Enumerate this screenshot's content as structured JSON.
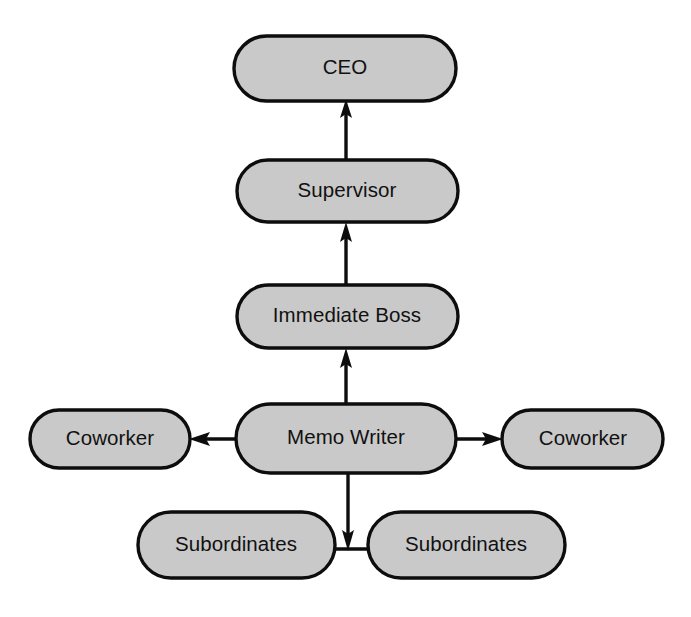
{
  "diagram": {
    "type": "flow-diagram",
    "canvas": {
      "width": 691,
      "height": 617
    },
    "background_color": "#ffffff",
    "node_fill_color": "#c9c9c9",
    "node_border_color": "#0d0d0d",
    "connector_color": "#0d0d0d",
    "nodes": [
      {
        "id": "ceo",
        "label": "CEO",
        "shape": "stadium",
        "x": 234,
        "y": 36,
        "width": 222,
        "height": 65,
        "center_x": 345,
        "center_y": 68
      },
      {
        "id": "supervisor",
        "label": "Supervisor",
        "shape": "stadium",
        "x": 237,
        "y": 160,
        "width": 221,
        "height": 62,
        "center_x": 347,
        "center_y": 191
      },
      {
        "id": "immediate-boss",
        "label": "Immediate Boss",
        "shape": "stadium",
        "x": 237,
        "y": 285,
        "width": 221,
        "height": 63,
        "center_x": 347,
        "center_y": 316
      },
      {
        "id": "memo-writer",
        "label": "Memo Writer",
        "shape": "stadium",
        "x": 236,
        "y": 404,
        "width": 220,
        "height": 69,
        "center_x": 346,
        "center_y": 438
      },
      {
        "id": "coworker-left",
        "label": "Coworker",
        "shape": "stadium",
        "x": 30,
        "y": 410,
        "width": 160,
        "height": 58,
        "center_x": 110,
        "center_y": 439
      },
      {
        "id": "coworker-right",
        "label": "Coworker",
        "shape": "stadium",
        "x": 502,
        "y": 410,
        "width": 161,
        "height": 58,
        "center_x": 582,
        "center_y": 439
      },
      {
        "id": "subordinates-left",
        "label": "Subordinates",
        "shape": "stadium",
        "x": 138,
        "y": 512,
        "width": 197,
        "height": 66,
        "center_x": 236,
        "center_y": 545
      },
      {
        "id": "subordinates-right",
        "label": "Subordinates",
        "shape": "stadium",
        "x": 368,
        "y": 512,
        "width": 197,
        "height": 66,
        "center_x": 466,
        "center_y": 545
      }
    ],
    "connectors": [
      {
        "id": "supervisor-to-ceo",
        "from": "supervisor",
        "to": "ceo",
        "direction": "up",
        "arrowhead": "at-target"
      },
      {
        "id": "immediate-boss-to-supervisor",
        "from": "immediate-boss",
        "to": "supervisor",
        "direction": "up",
        "arrowhead": "at-target"
      },
      {
        "id": "memo-writer-to-immediate-boss",
        "from": "memo-writer",
        "to": "immediate-boss",
        "direction": "up",
        "arrowhead": "at-target"
      },
      {
        "id": "memo-writer-to-coworker-left",
        "from": "memo-writer",
        "to": "coworker-left",
        "direction": "left",
        "arrowhead": "at-target"
      },
      {
        "id": "memo-writer-to-coworker-right",
        "from": "memo-writer",
        "to": "coworker-right",
        "direction": "right",
        "arrowhead": "at-target"
      },
      {
        "id": "memo-writer-to-subordinates",
        "from": "memo-writer",
        "to": "subordinates-junction",
        "direction": "down",
        "arrowhead": "at-target"
      },
      {
        "id": "subordinates-bridge",
        "from": "subordinates-left",
        "to": "subordinates-right",
        "direction": "horizontal",
        "arrowhead": "none"
      }
    ]
  }
}
